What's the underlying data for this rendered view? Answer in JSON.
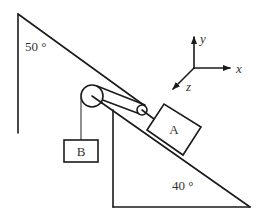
{
  "figure": {
    "angle_top_label": "50 °",
    "angle_bottom_label": "40 °",
    "block_a_label": "A",
    "block_b_label": "B",
    "axes": {
      "x_label": "x",
      "y_label": "y",
      "z_label": "z"
    },
    "colors": {
      "stroke": "#1a1a1a",
      "text": "#333333",
      "background": "#ffffff"
    }
  }
}
